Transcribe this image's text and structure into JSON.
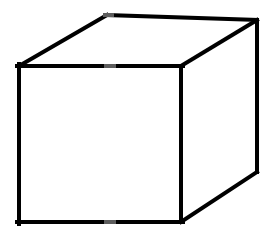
{
  "figure": {
    "shape_name": "cube",
    "projection": "oblique parallel projection",
    "canvas": {
      "width": 270,
      "height": 240
    },
    "style": {
      "background_color": "#ffffff",
      "stroke_color": "#000000",
      "face_fill_color": "#ffffff",
      "stroke_width": 4,
      "seam_artifact_color": "#5d5d5d"
    },
    "vertices": {
      "front_top_left": {
        "x": 19,
        "y": 66
      },
      "front_top_right": {
        "x": 181,
        "y": 66
      },
      "front_bottom_right": {
        "x": 181,
        "y": 222
      },
      "front_bottom_left": {
        "x": 19,
        "y": 222
      },
      "back_top_left": {
        "x": 107,
        "y": 15
      },
      "back_top_right": {
        "x": 257,
        "y": 20
      },
      "back_bottom_right": {
        "x": 257,
        "y": 172
      }
    },
    "faces": [
      {
        "name": "front-face",
        "points": "19,66 181,66 181,222 19,222"
      },
      {
        "name": "top-face",
        "points": "19,66 107,15 257,20 181,66"
      },
      {
        "name": "right-face",
        "points": "181,66 257,20 257,172 181,222"
      }
    ],
    "edges": [
      {
        "name": "front-top-edge",
        "from": "front_top_left",
        "to": "front_top_right",
        "visible": true
      },
      {
        "name": "front-right-edge",
        "from": "front_top_right",
        "to": "front_bottom_right",
        "visible": true
      },
      {
        "name": "front-bottom-edge",
        "from": "front_bottom_right",
        "to": "front_bottom_left",
        "visible": true
      },
      {
        "name": "front-left-edge",
        "from": "front_bottom_left",
        "to": "front_top_left",
        "visible": true
      },
      {
        "name": "top-left-receding-edge",
        "from": "front_top_left",
        "to": "back_top_left",
        "visible": true
      },
      {
        "name": "back-top-edge",
        "from": "back_top_left",
        "to": "back_top_right",
        "visible": true
      },
      {
        "name": "top-right-receding-edge",
        "from": "front_top_right",
        "to": "back_top_right",
        "visible": true
      },
      {
        "name": "back-right-vertical-edge",
        "from": "back_top_right",
        "to": "back_bottom_right",
        "visible": true
      },
      {
        "name": "bottom-right-receding-edge",
        "from": "front_bottom_right",
        "to": "back_bottom_right",
        "visible": true
      }
    ],
    "hidden_edges_count": 3,
    "seam_artifacts": [
      {
        "name": "top-edge-seam",
        "x1": 104,
        "y1": 66,
        "x2": 116,
        "y2": 66
      },
      {
        "name": "bottom-edge-seam",
        "x1": 104,
        "y1": 222,
        "x2": 116,
        "y2": 222
      },
      {
        "name": "back-top-seam",
        "x1": 103,
        "y1": 15,
        "x2": 114,
        "y2": 15
      }
    ]
  }
}
